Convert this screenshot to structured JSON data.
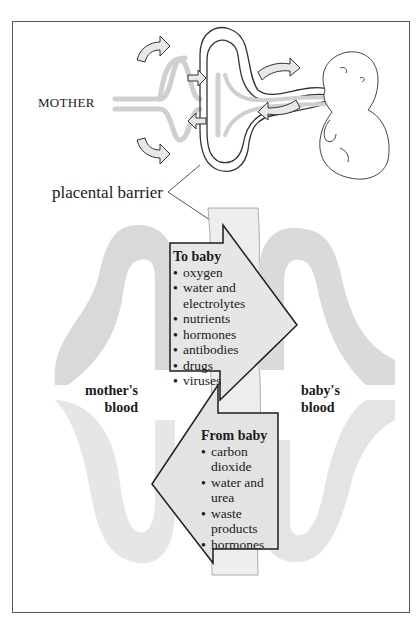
{
  "header_caption": "...fetus through the placental barrier...",
  "labels": {
    "mother": "MOTHER",
    "placental_barrier": "placental barrier",
    "mother_blood": "mother's blood",
    "mother_blood_line1": "mother's",
    "mother_blood_line2": "blood",
    "baby_blood_line1": "baby's",
    "baby_blood_line2": "blood"
  },
  "to_baby": {
    "title": "To baby",
    "items": [
      "oxygen",
      "water and electrolytes",
      "nutrients",
      "hormones",
      "antibodies",
      "drugs",
      "viruses"
    ]
  },
  "from_baby": {
    "title": "From baby",
    "items": [
      "carbon dioxide",
      "water and urea",
      "waste products",
      "hormones"
    ]
  },
  "colors": {
    "vessel_mother": "#d8d8d8",
    "vessel_baby": "#dcdcdc",
    "arrow_fill": "#e4e4e4",
    "barrier": "#efefef",
    "line": "#222222"
  }
}
